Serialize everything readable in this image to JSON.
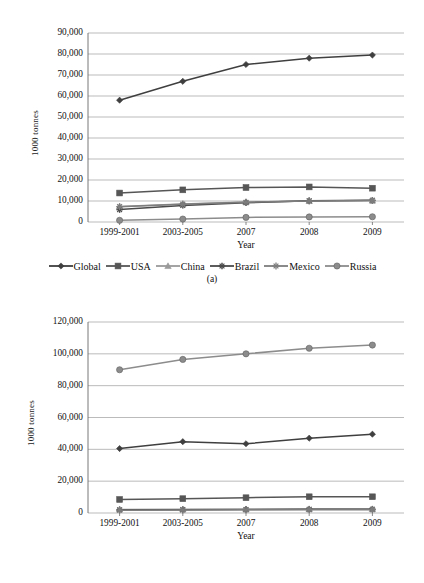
{
  "figure": {
    "panels": [
      {
        "caption": "(a)",
        "chart_data": {
          "type": "line",
          "title": "",
          "xlabel": "Year",
          "ylabel": "1000 tonnes",
          "categories": [
            "1999-2001",
            "2003-2005",
            "2007",
            "2008",
            "2009"
          ],
          "ylim": [
            0,
            90000
          ],
          "yticks": [
            "0",
            "10,000",
            "20,000",
            "30,000",
            "40,000",
            "50,000",
            "60,000",
            "70,000",
            "80,000",
            "90,000"
          ],
          "ytick_values": [
            0,
            10000,
            20000,
            30000,
            40000,
            50000,
            60000,
            70000,
            80000,
            90000
          ],
          "grid": true,
          "legend_position": "bottom",
          "series": [
            {
              "name": "Global",
              "marker": "diamond",
              "color": "#3f3f3f",
              "values": [
                58000,
                67000,
                75000,
                78000,
                79500
              ]
            },
            {
              "name": "USA",
              "marker": "square",
              "color": "#565656",
              "values": [
                13800,
                15300,
                16400,
                16700,
                16100
              ]
            },
            {
              "name": "China",
              "marker": "triangle",
              "color": "#9a9a9a",
              "values": [
                7400,
                8600,
                9500,
                10000,
                10200
              ]
            },
            {
              "name": "Brazil",
              "marker": "cross",
              "color": "#4a4a4a",
              "values": [
                5900,
                7900,
                9200,
                10100,
                10300
              ]
            },
            {
              "name": "Mexico",
              "marker": "star",
              "color": "#7d7d7d",
              "values": [
                7300,
                8500,
                9400,
                10000,
                10200
              ]
            },
            {
              "name": "Russia",
              "marker": "circle",
              "color": "#8c8c8c",
              "values": [
                800,
                1400,
                2200,
                2400,
                2500
              ]
            }
          ]
        }
      },
      {
        "caption": "(b)",
        "chart_data": {
          "type": "line",
          "title": "",
          "xlabel": "Year",
          "ylabel": "1000 tonnes",
          "categories": [
            "1999-2001",
            "2003-2005",
            "2007",
            "2008",
            "2009"
          ],
          "ylim": [
            0,
            120000
          ],
          "yticks": [
            "0",
            "20,000",
            "40,000",
            "60,000",
            "80,000",
            "100,000",
            "120,000"
          ],
          "ytick_values": [
            0,
            20000,
            40000,
            60000,
            80000,
            100000,
            120000
          ],
          "grid": true,
          "legend_position": "bottom",
          "series": [
            {
              "name": "China",
              "marker": "diamond",
              "color": "#3f3f3f",
              "values": [
                40500,
                44800,
                43500,
                47000,
                49500
              ]
            },
            {
              "name": "USA",
              "marker": "square",
              "color": "#565656",
              "values": [
                8500,
                9000,
                9600,
                10200,
                10200
              ]
            },
            {
              "name": "Spain",
              "marker": "triangle",
              "color": "#9a9a9a",
              "values": [
                2200,
                2300,
                2400,
                2500,
                2500
              ]
            },
            {
              "name": "Brazil",
              "marker": "cross",
              "color": "#4a4a4a",
              "values": [
                2000,
                2100,
                2200,
                2300,
                2400
              ]
            },
            {
              "name": "Russia",
              "marker": "star",
              "color": "#7d7d7d",
              "values": [
                1800,
                1900,
                2000,
                2100,
                2100
              ]
            },
            {
              "name": "Global",
              "marker": "circle",
              "color": "#8c8c8c",
              "values": [
                90000,
                96500,
                100000,
                103500,
                105500
              ]
            }
          ]
        }
      }
    ]
  }
}
